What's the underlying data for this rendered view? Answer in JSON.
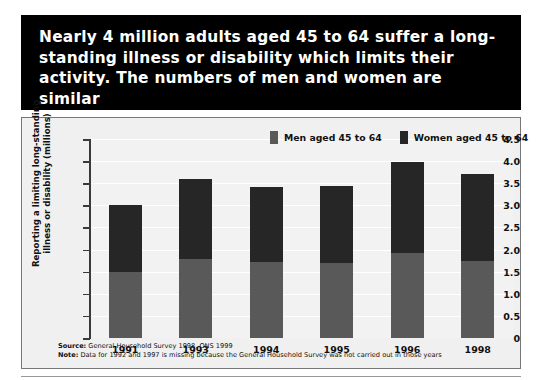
{
  "title": "Nearly 4 million adults aged 45 to 64 suffer a long-standing illness or disability which limits their activity. The numbers of men and women are similar",
  "footnotes": {
    "source_label": "Source:",
    "source_text": " General Household Survey 1998, ONS 1999",
    "note_label": "Note:",
    "note_text": " Data for 1992 and 1997 is missing because the General Household Survey was not carried out in those years"
  },
  "colors": {
    "men": "#595959",
    "women": "#262626",
    "banner": "#000000",
    "panel": "#f0f0f0",
    "plot": "#f2f2f2",
    "grid": "#ffffff",
    "axis": "#3a3a3a"
  },
  "chart_data": {
    "type": "bar",
    "subtype": "stacked",
    "title": "",
    "xlabel": "",
    "ylabel": "Reporting a limiting long-standing illness or disability (millions)",
    "categories": [
      "1991",
      "1993",
      "1994",
      "1995",
      "1996",
      "1998"
    ],
    "ylim": [
      0,
      4.5
    ],
    "yticks": [
      0,
      0.5,
      1.0,
      1.5,
      2.0,
      2.5,
      3.0,
      3.5,
      4.0,
      4.5
    ],
    "ytick_labels": [
      "0",
      "0.5",
      "1.0",
      "1.5",
      "2.0",
      "2.5",
      "3.0",
      "3.5",
      "4.0",
      "4.5"
    ],
    "grid": true,
    "legend_position": "top-right",
    "series": [
      {
        "name": "Men aged 45 to 64",
        "color": "#595959",
        "values": [
          1.5,
          1.78,
          1.72,
          1.7,
          1.93,
          1.75
        ]
      },
      {
        "name": "Women aged 45 to 64",
        "color": "#262626",
        "values": [
          1.5,
          1.82,
          1.7,
          1.73,
          2.04,
          1.97
        ]
      }
    ],
    "totals": [
      3.0,
      3.6,
      3.42,
      3.43,
      3.97,
      3.72
    ]
  }
}
